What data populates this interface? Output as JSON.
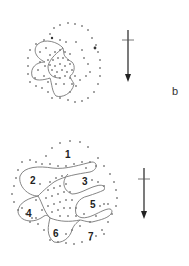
{
  "figure": {
    "panel_label": "b",
    "top_diagram": {
      "description": "Dotted circular field with lobed outlines, overlapping dense stippled center",
      "arrow": "north-south arrow pointing down with crossbar"
    },
    "bottom_diagram": {
      "region_labels": [
        "1",
        "2",
        "3",
        "4",
        "5",
        "6",
        "7"
      ],
      "arrow": "north-south arrow pointing down with crossbar"
    }
  }
}
